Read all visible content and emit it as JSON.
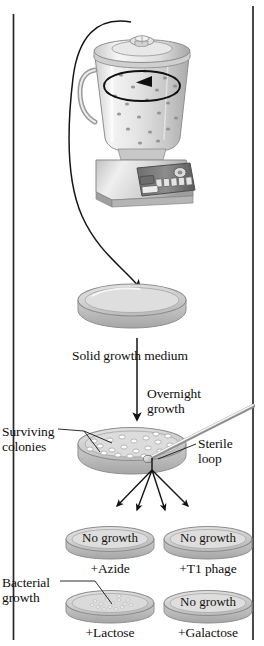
{
  "figure": {
    "name": "bacterial-mutant-selection-experiment",
    "steps": {
      "blender": {
        "icon": "blender-icon",
        "circulation_arrow": "circular-arrow-icon"
      },
      "solid_medium_label": "Solid growth medium",
      "overnight_growth_label": "Overnight\ngrowth",
      "surviving_colonies_label": "Surviving\ncolonies",
      "sterile_loop_label": "Sterile\nloop",
      "bacterial_growth_label": "Bacterial\ngrowth"
    },
    "plates": [
      {
        "id": "plate-azide",
        "result": "No growth",
        "condition": "+Azide",
        "has_growth": false,
        "row": 0,
        "col": 0
      },
      {
        "id": "plate-t1-phage",
        "result": "No growth",
        "condition": "+T1 phage",
        "has_growth": false,
        "row": 0,
        "col": 1
      },
      {
        "id": "plate-lactose",
        "result": "",
        "condition": "+Lactose",
        "has_growth": true,
        "row": 1,
        "col": 0
      },
      {
        "id": "plate-galactose",
        "result": "No growth",
        "condition": "+Galactose",
        "has_growth": false,
        "row": 1,
        "col": 1
      }
    ],
    "colors": {
      "ink": "#100d0c",
      "line": "#1a1a1a",
      "glass_light": "#f2f2f2",
      "glass_mid": "#d8d8d8",
      "glass_dark": "#a9a9a9",
      "plate_fill": "#d5d5d5",
      "plate_rim": "#9b9b9b",
      "frame": "#2a2a2a"
    }
  }
}
